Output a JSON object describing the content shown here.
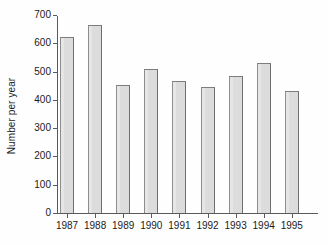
{
  "chart_data": {
    "type": "bar",
    "title": "",
    "subtitle": "",
    "xlabel": "",
    "ylabel": "Number per year",
    "categories": [
      "1987",
      "1988",
      "1989",
      "1990",
      "1991",
      "1992",
      "1993",
      "1994",
      "1995"
    ],
    "values": [
      622,
      665,
      452,
      508,
      466,
      445,
      484,
      530,
      431
    ],
    "series": [
      {
        "name": "Number per year",
        "values": [
          622,
          665,
          452,
          508,
          466,
          445,
          484,
          530,
          431
        ]
      }
    ],
    "ylim": [
      0,
      700
    ],
    "ytick_labels": [
      "0",
      "100",
      "200",
      "300",
      "400",
      "500",
      "600",
      "700"
    ],
    "ytick_values": [
      0,
      100,
      200,
      300,
      400,
      500,
      600,
      700
    ],
    "grid": false,
    "legend": false,
    "legend_position": "none",
    "bar_fill_color": "#dcdcdc",
    "bar_edge_color": "#7d7d7d",
    "axis_color": "#5a5a5a",
    "background_color": "#fefefe"
  }
}
